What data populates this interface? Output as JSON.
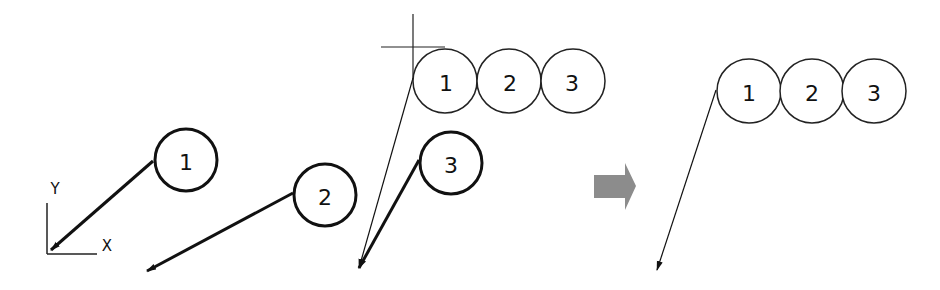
{
  "axes": {
    "x_label": "X",
    "y_label": "Y"
  },
  "before": {
    "balloons": [
      {
        "label": "1"
      },
      {
        "label": "2"
      },
      {
        "label": "3"
      }
    ]
  },
  "during": {
    "stacked_balloons": [
      {
        "label": "1"
      },
      {
        "label": "2"
      },
      {
        "label": "3"
      }
    ]
  },
  "transition_arrow": {
    "color": "#8c8c8c"
  },
  "after": {
    "stacked_balloons": [
      {
        "label": "1"
      },
      {
        "label": "2"
      },
      {
        "label": "3"
      }
    ]
  }
}
